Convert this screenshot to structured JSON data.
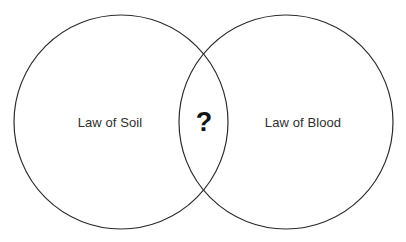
{
  "diagram": {
    "type": "venn",
    "background_color": "#ffffff",
    "stroke_color": "#2b2b2b",
    "text_color": "#2f2f2f",
    "sets": [
      {
        "id": "left",
        "label": "Law of Soil",
        "center_x": 121,
        "center_y": 122,
        "radius": 107
      },
      {
        "id": "right",
        "label": "Law of Blood",
        "center_x": 286,
        "center_y": 122,
        "radius": 107
      }
    ],
    "intersection": {
      "label": "?",
      "center_x": 204,
      "center_y": 122
    }
  }
}
